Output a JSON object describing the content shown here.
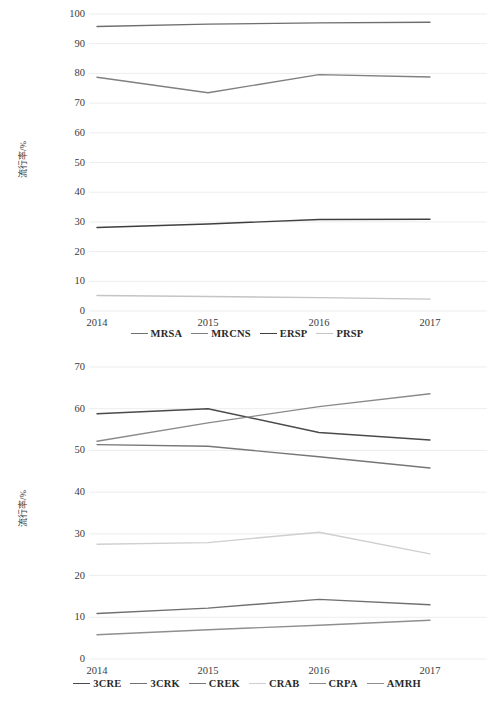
{
  "figure": {
    "axis": {
      "xticks": [
        "2014",
        "2015",
        "2016",
        "2017"
      ],
      "ylabel": "流行率/%"
    }
  },
  "chart_data": [
    {
      "id": "chart-top",
      "type": "line",
      "title": "",
      "xlabel": "",
      "ylabel": "流行率/%",
      "x": [
        "2014",
        "2015",
        "2016",
        "2017"
      ],
      "categories": [
        "2014",
        "2015",
        "2016",
        "2017"
      ],
      "ylim": [
        0,
        100
      ],
      "yticks": [
        0,
        10,
        20,
        30,
        40,
        50,
        60,
        70,
        80,
        90,
        100
      ],
      "grid": true,
      "legend_position": "bottom",
      "series": [
        {
          "name": "MRSA",
          "values": [
            95.8,
            96.6,
            97.0,
            97.2
          ],
          "color": "#6e6e6e"
        },
        {
          "name": "MRCNS",
          "values": [
            78.7,
            73.5,
            79.6,
            78.8
          ],
          "color": "#808080"
        },
        {
          "name": "ERSP",
          "values": [
            28.1,
            29.3,
            30.8,
            30.9
          ],
          "color": "#3f3f3f"
        },
        {
          "name": "PRSP",
          "values": [
            5.2,
            4.9,
            4.5,
            4.0
          ],
          "color": "#c4c4c4"
        }
      ]
    },
    {
      "id": "chart-bottom",
      "type": "line",
      "title": "",
      "xlabel": "",
      "ylabel": "流行率/%",
      "x": [
        "2014",
        "2015",
        "2016",
        "2017"
      ],
      "categories": [
        "2014",
        "2015",
        "2016",
        "2017"
      ],
      "ylim": [
        0,
        70
      ],
      "yticks": [
        0,
        10,
        20,
        30,
        40,
        50,
        60,
        70
      ],
      "grid": true,
      "legend_position": "bottom",
      "series": [
        {
          "name": "3CRE",
          "values": [
            58.8,
            60.0,
            54.3,
            52.5
          ],
          "color": "#4a4a4a"
        },
        {
          "name": "3CRK",
          "values": [
            10.9,
            12.2,
            14.3,
            13.0
          ],
          "color": "#707070"
        },
        {
          "name": "CREK",
          "values": [
            51.4,
            51.0,
            48.5,
            45.8
          ],
          "color": "#767676"
        },
        {
          "name": "CRAB",
          "values": [
            27.5,
            27.9,
            30.4,
            25.2
          ],
          "color": "#cfcfcf"
        },
        {
          "name": "CRPA",
          "values": [
            52.2,
            56.6,
            60.5,
            63.6
          ],
          "color": "#8a8a8a"
        },
        {
          "name": "AMRH",
          "values": [
            5.8,
            7.0,
            8.1,
            9.3
          ],
          "color": "#8f8f8f"
        }
      ]
    }
  ]
}
